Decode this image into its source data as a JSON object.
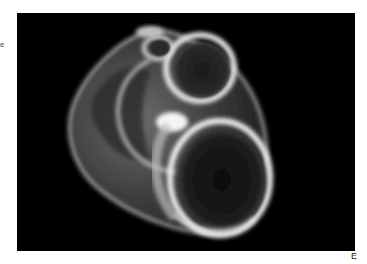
{
  "figure": {
    "panel_label": "E",
    "side_fragment": "e",
    "image_subject": "shell-micrograph",
    "colors": {
      "background": "#000000",
      "shell_highlight": "#f2f2f2",
      "shell_mid": "#8a8a8a",
      "aperture_dark": "#141414",
      "page": "#ffffff"
    }
  }
}
